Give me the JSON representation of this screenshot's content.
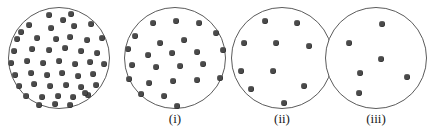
{
  "figure": {
    "title": "",
    "background_color": "#ffffff",
    "circle_outline_color": "#5b5b5b",
    "dot_color": "#4a4a4a",
    "panels": [
      {
        "id": "panel-0",
        "label": "",
        "dot_count": 48,
        "circle": {
          "cx": 59,
          "cy": 58,
          "r": 51
        },
        "dot_radius": 3.0,
        "dots": [
          [
            48,
            14
          ],
          [
            70,
            13
          ],
          [
            28,
            24
          ],
          [
            50,
            27
          ],
          [
            73,
            25
          ],
          [
            90,
            23
          ],
          [
            16,
            38
          ],
          [
            36,
            37
          ],
          [
            55,
            38
          ],
          [
            69,
            36
          ],
          [
            86,
            39
          ],
          [
            101,
            37
          ],
          [
            13,
            50
          ],
          [
            31,
            48
          ],
          [
            48,
            49
          ],
          [
            64,
            47
          ],
          [
            80,
            50
          ],
          [
            96,
            52
          ],
          [
            10,
            62
          ],
          [
            26,
            60
          ],
          [
            42,
            62
          ],
          [
            58,
            60
          ],
          [
            74,
            63
          ],
          [
            89,
            61
          ],
          [
            103,
            63
          ],
          [
            14,
            74
          ],
          [
            30,
            72
          ],
          [
            46,
            74
          ],
          [
            61,
            72
          ],
          [
            77,
            75
          ],
          [
            92,
            73
          ],
          [
            18,
            85
          ],
          [
            33,
            83
          ],
          [
            49,
            85
          ],
          [
            65,
            84
          ],
          [
            80,
            86
          ],
          [
            95,
            84
          ],
          [
            25,
            95
          ],
          [
            41,
            96
          ],
          [
            57,
            95
          ],
          [
            72,
            96
          ],
          [
            87,
            94
          ],
          [
            38,
            104
          ],
          [
            54,
            103
          ],
          [
            69,
            104
          ],
          [
            20,
            31
          ],
          [
            84,
            92
          ],
          [
            62,
            19
          ]
        ]
      },
      {
        "id": "panel-1",
        "label": "(i)",
        "dot_count": 24,
        "circle": {
          "cx": 175,
          "cy": 58,
          "r": 51
        },
        "dot_radius": 3.0,
        "dots": [
          [
            152,
            22
          ],
          [
            175,
            20
          ],
          [
            198,
            22
          ],
          [
            134,
            35
          ],
          [
            215,
            32
          ],
          [
            159,
            42
          ],
          [
            183,
            39
          ],
          [
            127,
            48
          ],
          [
            147,
            54
          ],
          [
            171,
            52
          ],
          [
            196,
            51
          ],
          [
            222,
            49
          ],
          [
            131,
            64
          ],
          [
            155,
            66
          ],
          [
            179,
            65
          ],
          [
            202,
            63
          ],
          [
            128,
            78
          ],
          [
            148,
            82
          ],
          [
            172,
            80
          ],
          [
            196,
            79
          ],
          [
            219,
            77
          ],
          [
            140,
            93
          ],
          [
            163,
            95
          ],
          [
            176,
            105
          ]
        ]
      },
      {
        "id": "panel-2",
        "label": "(ii)",
        "dot_count": 10,
        "circle": {
          "cx": 282,
          "cy": 58,
          "r": 51
        },
        "dot_radius": 3.0,
        "dots": [
          [
            264,
            20
          ],
          [
            296,
            22
          ],
          [
            243,
            42
          ],
          [
            275,
            42
          ],
          [
            308,
            45
          ],
          [
            240,
            70
          ],
          [
            272,
            70
          ],
          [
            250,
            88
          ],
          [
            303,
            85
          ],
          [
            283,
            102
          ]
        ]
      },
      {
        "id": "panel-3",
        "label": "(iii)",
        "dot_count": 6,
        "circle": {
          "cx": 376,
          "cy": 58,
          "r": 51
        },
        "dot_radius": 3.0,
        "dots": [
          [
            381,
            23
          ],
          [
            348,
            42
          ],
          [
            380,
            58
          ],
          [
            359,
            72
          ],
          [
            406,
            76
          ],
          [
            358,
            92
          ]
        ]
      }
    ],
    "label_y": 112
  }
}
